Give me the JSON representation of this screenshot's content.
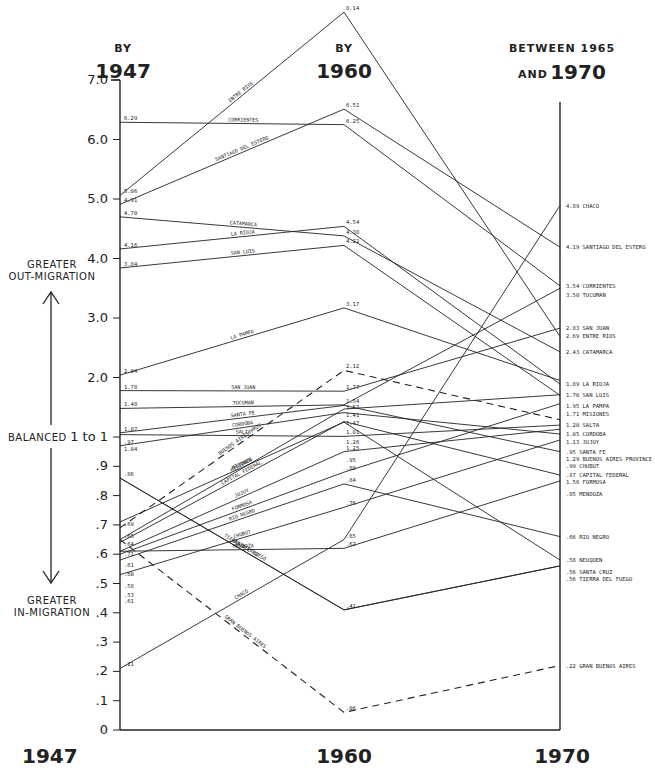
{
  "chart_data": {
    "type": "line",
    "title": "",
    "column_headers": [
      {
        "small": "BY",
        "big": "1947"
      },
      {
        "small": "BY",
        "big": "1960"
      },
      {
        "small": "BETWEEN 1965",
        "prefix": "AND",
        "big": "1970"
      }
    ],
    "x": [
      "1947",
      "1960",
      "1970"
    ],
    "xlabel": "",
    "ylabel": "",
    "y_ticks_upper": [
      "7.0",
      "6.0",
      "5.0",
      "4.0",
      "3.0",
      "2.0"
    ],
    "y_ticks_upper_values": [
      7,
      6,
      5,
      4,
      3,
      2
    ],
    "y_tick_balance": "BALANCED 1 to 1",
    "y_tick_balance_short": "1 to 1",
    "y_ticks_lower": [
      ".9",
      ".8",
      ".7",
      ".6",
      ".5",
      ".4",
      ".3",
      ".2",
      ".1",
      "0"
    ],
    "y_ticks_lower_values": [
      0.9,
      0.8,
      0.7,
      0.6,
      0.5,
      0.4,
      0.3,
      0.2,
      0.1,
      0
    ],
    "ylim": [
      0,
      8.2
    ],
    "scale_note": "piecewise: linear 0-1 in tenths (expanded), linear 1-8 in units",
    "side_annotations": {
      "top": [
        "GREATER",
        "OUT-MIGRATION"
      ],
      "middle": "BALANCED",
      "bottom": [
        "GREATER",
        "IN-MIGRATION"
      ]
    },
    "series": [
      {
        "name": "ENTRE RIOS",
        "end_label": "ENTRE RIOS",
        "values": [
          5.06,
          8.14,
          2.69
        ],
        "labels": [
          "5.06",
          "8.14",
          "2.69"
        ],
        "dashed": false
      },
      {
        "name": "CORRIENTES",
        "end_label": "CORRIENTES",
        "values": [
          6.29,
          6.25,
          3.54
        ],
        "labels": [
          "6.29",
          "6.25",
          "3.54"
        ],
        "dashed": false
      },
      {
        "name": "SANTIAGO DEL ESTERO",
        "end_label": "SANTIAGO DEL ESTERO",
        "values": [
          4.91,
          6.51,
          4.19
        ],
        "labels": [
          "4.91",
          "6.51",
          "4.19"
        ],
        "dashed": false
      },
      {
        "name": "CATAMARCA",
        "end_label": "CATAMARCA",
        "values": [
          4.7,
          4.38,
          2.43
        ],
        "labels": [
          "4.70",
          "4.38",
          "2.43"
        ],
        "dashed": false
      },
      {
        "name": "LA RIOJA",
        "end_label": "LA RIOJA",
        "values": [
          4.16,
          4.54,
          1.89
        ],
        "labels": [
          "4.16",
          "4.54",
          "1.89"
        ],
        "dashed": false
      },
      {
        "name": "SAN LUIS",
        "end_label": "SAN LUIS",
        "values": [
          3.84,
          4.22,
          1.7
        ],
        "labels": [
          "3.84",
          "4.22",
          "1.70"
        ],
        "dashed": false
      },
      {
        "name": "LA PAMPA",
        "end_label": "LA PAMPA",
        "values": [
          2.04,
          3.17,
          1.95
        ],
        "labels": [
          "2.04",
          "3.17",
          "1.95"
        ],
        "dashed": false
      },
      {
        "name": "SAN JUAN",
        "end_label": "SAN JUAN",
        "values": [
          1.78,
          1.77,
          2.83
        ],
        "labels": [
          "1.78",
          "1.77",
          "2.83"
        ],
        "dashed": false
      },
      {
        "name": "TUCUMAN",
        "end_label": "TUCUMAN",
        "values": [
          1.48,
          1.54,
          3.5
        ],
        "labels": [
          "1.48",
          "1.54",
          "3.50"
        ],
        "dashed": false
      },
      {
        "name": "SANTA FE",
        "end_label": "SANTA FE",
        "values": [
          1.07,
          1.53,
          0.95
        ],
        "labels": [
          "1.07",
          "1.53",
          ".95"
        ],
        "dashed": false
      },
      {
        "name": "CORDOBA",
        "end_label": "CORDOBA",
        "values": [
          0.97,
          1.41,
          1.05
        ],
        "labels": [
          ".97",
          "1.41",
          "1.05"
        ],
        "dashed": false
      },
      {
        "name": "SALTA",
        "end_label": "SALTA",
        "values": [
          1.04,
          1.01,
          1.2
        ],
        "labels": [
          "1.04",
          "1.01",
          "1.20"
        ],
        "dashed": false
      },
      {
        "name": "BUENOS AIRES PROV.",
        "end_label": "BUENOS AIRES PROVINCE",
        "values": [
          0.69,
          2.12,
          1.29
        ],
        "labels": [
          ".69",
          "2.12",
          "1.29"
        ],
        "dashed": true
      },
      {
        "name": "MISIONES",
        "end_label": "MISIONES",
        "values": [
          0.65,
          1.47,
          1.71
        ],
        "labels": [
          ".65",
          "1.47",
          "1.71"
        ],
        "dashed": false
      },
      {
        "name": "CAPITAL FEDERAL",
        "end_label": "CAPITAL FEDERAL",
        "values": [
          0.64,
          1.26,
          0.87
        ],
        "labels": [
          ".64",
          "1.26",
          ".87"
        ],
        "dashed": false
      },
      {
        "name": "NEUQUEN",
        "end_label": "NEUQUEN",
        "values": [
          0.71,
          1.25,
          0.58
        ],
        "labels": [
          ".71",
          "1.25",
          ".58"
        ],
        "dashed": false
      },
      {
        "name": "JUJUY",
        "end_label": "JUJUY",
        "values": [
          0.61,
          0.95,
          1.13
        ],
        "labels": [
          ".61",
          ".95",
          "1.13"
        ],
        "dashed": false
      },
      {
        "name": "FORMOSA",
        "end_label": "FORMOSA",
        "values": [
          0.6,
          0.88,
          1.56
        ],
        "labels": [
          ".60",
          ".88",
          "1.56"
        ],
        "dashed": false
      },
      {
        "name": "RIO NEGRO",
        "end_label": "RIO NEGRO",
        "values": [
          0.58,
          0.84,
          0.66
        ],
        "labels": [
          ".58",
          ".84",
          ".66"
        ],
        "dashed": false
      },
      {
        "name": "CHUBUT",
        "end_label": "CHUBUT",
        "values": [
          0.53,
          0.76,
          0.99
        ],
        "labels": [
          ".53",
          ".76",
          ".99"
        ],
        "dashed": false
      },
      {
        "name": "MENDOZA",
        "end_label": "MENDOZA",
        "values": [
          0.61,
          0.62,
          0.85
        ],
        "labels": [
          ".61",
          ".62",
          ".85"
        ],
        "dashed": false
      },
      {
        "name": "SANTA CRUZ",
        "end_label": "SANTA CRUZ",
        "values": [
          0.86,
          0.41,
          0.56
        ],
        "labels": [
          ".86",
          ".41",
          ".56"
        ],
        "dashed": false
      },
      {
        "name": "TIERRA DEL FUEGO",
        "end_label": "TIERRA DEL FUEGO",
        "values": [
          0.86,
          0.41,
          0.56
        ],
        "labels": [
          "",
          "",
          ".56"
        ],
        "dashed": false
      },
      {
        "name": "CHACO",
        "end_label": "CHACO",
        "values": [
          0.21,
          0.65,
          4.89
        ],
        "labels": [
          ".21",
          ".65",
          "4.89"
        ],
        "dashed": false
      },
      {
        "name": "GRAN BUENOS AIRES",
        "end_label": "GRAN BUENOS AIRES",
        "values": [
          0.65,
          0.06,
          0.22
        ],
        "labels": [
          "",
          ".06",
          ".22"
        ],
        "dashed": true
      }
    ]
  }
}
